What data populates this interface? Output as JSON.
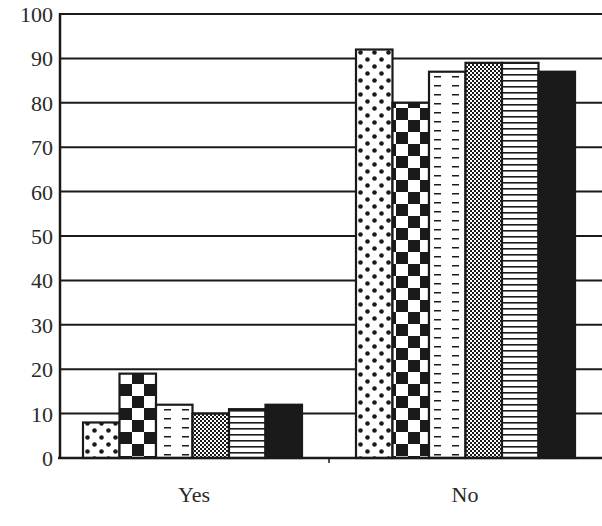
{
  "chart_data": {
    "type": "bar",
    "title": "",
    "xlabel": "",
    "ylabel": "",
    "ylim": [
      0,
      100
    ],
    "yticks": [
      0,
      10,
      20,
      30,
      40,
      50,
      60,
      70,
      80,
      90,
      100
    ],
    "grid": true,
    "legend": "none visible",
    "categories": [
      "Yes",
      "No"
    ],
    "series": [
      {
        "name": "Series 1",
        "pattern": "dots",
        "values": [
          8,
          92
        ]
      },
      {
        "name": "Series 2",
        "pattern": "checkerboard",
        "values": [
          19,
          80
        ]
      },
      {
        "name": "Series 3",
        "pattern": "dashes",
        "values": [
          12,
          87
        ]
      },
      {
        "name": "Series 4",
        "pattern": "crosshatch",
        "values": [
          10,
          89
        ]
      },
      {
        "name": "Series 5",
        "pattern": "horizontal-lines",
        "values": [
          11,
          89
        ]
      },
      {
        "name": "Series 6",
        "pattern": "solid-black",
        "values": [
          12,
          87
        ]
      }
    ]
  },
  "colors": {
    "ink": "#1a1a1a",
    "background": "#ffffff"
  }
}
